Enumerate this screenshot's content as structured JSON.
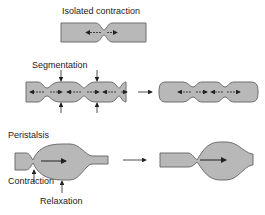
{
  "labels": {
    "isolated": "Isolated contraction",
    "segmentation": "Segmentation",
    "peristalsis": "Peristalsis",
    "contraction": "Contraction",
    "relaxation": "Relaxation"
  },
  "colors": {
    "tube_fill": "#b8b8b8",
    "tube_stroke": "#6e6e6e",
    "arrow": "#222222"
  }
}
